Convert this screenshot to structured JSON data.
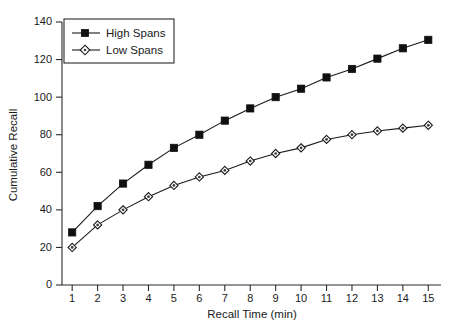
{
  "chart_data": {
    "type": "line",
    "title": "",
    "xlabel": "Recall Time (min)",
    "ylabel": "Cumulative Recall",
    "x": [
      1,
      2,
      3,
      4,
      5,
      6,
      7,
      8,
      9,
      10,
      11,
      12,
      13,
      14,
      15
    ],
    "xlim": [
      0.6,
      15.5
    ],
    "ylim": [
      0,
      140
    ],
    "grid": false,
    "legend_position": "upper-left",
    "xticks": [
      "1",
      "2",
      "3",
      "4",
      "5",
      "6",
      "7",
      "8",
      "9",
      "10",
      "11",
      "12",
      "13",
      "14",
      "15"
    ],
    "yticks": [
      "0",
      "20",
      "40",
      "60",
      "80",
      "100",
      "120",
      "140"
    ],
    "ytick_values": [
      0,
      20,
      40,
      60,
      80,
      100,
      120,
      140
    ],
    "series": [
      {
        "name": "High Spans",
        "marker": "filled-square",
        "color": "#101010",
        "values": [
          28,
          42,
          54,
          64,
          73,
          80,
          87.5,
          94,
          100,
          104.5,
          110.5,
          115,
          120.5,
          126,
          130.5
        ]
      },
      {
        "name": "Low Spans",
        "marker": "open-diamond",
        "color": "#1a1a1a",
        "values": [
          20,
          32,
          40,
          47,
          53,
          57.5,
          61,
          66,
          70,
          73,
          77.5,
          80,
          82,
          83.5,
          85
        ]
      }
    ]
  },
  "legend": {
    "entries": [
      {
        "label": "High Spans"
      },
      {
        "label": "Low Spans"
      }
    ]
  },
  "colors": {
    "background": "#ffffff",
    "axis": "#2b2b2b",
    "text": "#1a1a1a"
  }
}
